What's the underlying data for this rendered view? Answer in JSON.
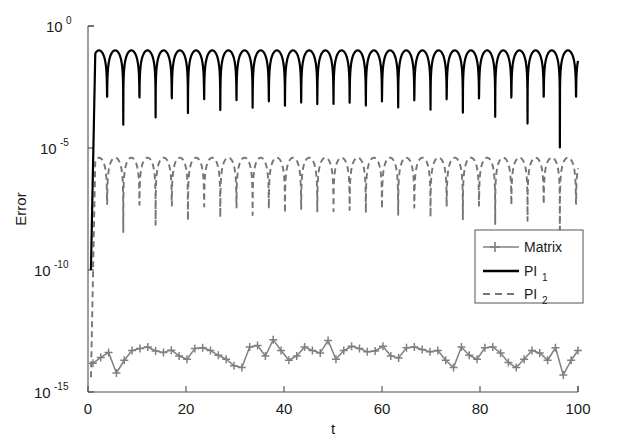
{
  "figure": {
    "background": "#ffffff",
    "type": "semilog-y line plot"
  },
  "axes": {
    "xlabel": "t",
    "ylabel": "Error",
    "x_ticks": [
      "0",
      "20",
      "40",
      "60",
      "80",
      "100"
    ],
    "x_tick_values": [
      0,
      20,
      40,
      60,
      80,
      100
    ],
    "y_tick_labels": [
      "10",
      "10",
      "10",
      "10"
    ],
    "y_tick_exponents": [
      "0",
      "-5",
      "-10",
      "-15"
    ],
    "y_tick_values": [
      1,
      1e-05,
      1e-10,
      1e-15
    ],
    "xlim": [
      0,
      100
    ],
    "ylim": [
      1e-15,
      1
    ],
    "yscale": "log",
    "grid": false
  },
  "legend": {
    "position": "center-right",
    "entries": [
      {
        "label": "Matrix",
        "sub": "",
        "color": "#808080",
        "style": "solid-with-plus-markers"
      },
      {
        "label": "PI",
        "sub": "1",
        "color": "#000000",
        "style": "solid"
      },
      {
        "label": "PI",
        "sub": "2",
        "color": "#808080",
        "style": "dashed"
      }
    ]
  },
  "colors": {
    "matrix": "#808080",
    "pi1": "#000000",
    "pi2": "#757575",
    "axis": "#4d4d4d",
    "text": "#1a1a1a"
  },
  "chart_data": {
    "type": "line",
    "title": "",
    "xlabel": "t",
    "ylabel": "Error",
    "yscale": "log",
    "xlim": [
      0,
      100
    ],
    "ylim": [
      1e-15,
      1
    ],
    "grid": false,
    "legend_position": "center-right",
    "series": [
      {
        "name": "Matrix",
        "color": "#808080",
        "style": "solid",
        "marker": "plus",
        "comment": "round-off level error oscillating near 1e-14 to 1e-13",
        "x": [
          1,
          2.6,
          4.2,
          5.8,
          7.4,
          9,
          10.6,
          12.2,
          13.8,
          15.4,
          17,
          18.6,
          20.2,
          21.8,
          23.4,
          25,
          26.6,
          28.2,
          29.8,
          31.4,
          33,
          34.6,
          36.2,
          37.8,
          39.4,
          41,
          42.6,
          44.2,
          45.8,
          47.4,
          49,
          50.6,
          52.2,
          53.8,
          55.4,
          57,
          58.6,
          60.2,
          61.8,
          63.4,
          65,
          66.6,
          68.2,
          69.8,
          71.4,
          73,
          74.6,
          76.2,
          77.8,
          79.4,
          81,
          82.6,
          84.2,
          85.8,
          87.4,
          89,
          90.6,
          92.2,
          93.8,
          95.4,
          97,
          98.6,
          100
        ],
        "y": [
          1.5e-14,
          2.6e-14,
          4.2e-14,
          6e-15,
          2e-14,
          5e-14,
          6e-14,
          7e-14,
          4.8e-14,
          4.2e-14,
          5.2e-14,
          3e-14,
          2.2e-14,
          6e-14,
          6.5e-14,
          5e-14,
          3.2e-14,
          2.2e-14,
          1.2e-14,
          1e-14,
          7e-14,
          8e-14,
          3e-14,
          1.4e-13,
          5e-14,
          2e-14,
          3e-14,
          7e-14,
          5e-14,
          4e-14,
          1.3e-13,
          2.2e-14,
          5e-14,
          7.5e-14,
          6e-14,
          4.5e-14,
          4.8e-14,
          7.5e-14,
          3e-14,
          2.5e-14,
          6.5e-14,
          7e-14,
          5.5e-14,
          4.5e-14,
          5e-14,
          2e-14,
          1e-14,
          7e-14,
          3.2e-14,
          2.2e-14,
          6.5e-14,
          7e-14,
          4e-14,
          1.6e-14,
          1e-14,
          2.2e-14,
          5e-14,
          4e-14,
          2e-14,
          6.5e-14,
          5e-15,
          2e-14,
          5e-14
        ]
      },
      {
        "name": "PI1",
        "color": "#000000",
        "style": "solid",
        "marker": "none",
        "comment": "oscillating envelope peaking near 1e-1 with ~30 lobes and deep nulls",
        "peak": 0.1,
        "n_lobes": 30,
        "null_depth": 1e-07,
        "period": 3.3
      },
      {
        "name": "PI2",
        "color": "#757575",
        "style": "dashed",
        "marker": "none",
        "comment": "oscillating envelope peaking near 1e-5 with deep nulls reaching 1e-9",
        "peak": 4e-06,
        "n_lobes": 30,
        "null_depth": 1e-09,
        "period": 3.3
      }
    ]
  }
}
